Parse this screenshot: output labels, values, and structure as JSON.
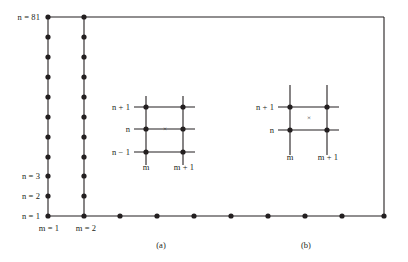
{
  "figure": {
    "background_color": "#ffffff",
    "line_color": "#231f20",
    "node_color": "#231f20",
    "text_color": "#231f20"
  },
  "grid": {
    "name": "computational-grid",
    "left_column_label_top": "n = 81",
    "left_axis_labels": [
      {
        "text": "n = 81",
        "n": 81
      },
      {
        "text": "n = 3",
        "n": 3
      },
      {
        "text": "n = 2",
        "n": 2
      },
      {
        "text": "n = 1",
        "n": 1
      }
    ],
    "bottom_axis_labels": [
      {
        "text": "m = 1",
        "m": 1
      },
      {
        "text": "m = 2",
        "m": 2
      }
    ],
    "column_node_count": 11,
    "bottom_node_count": 11
  },
  "stencil_a": {
    "name": "stencil-a",
    "caption": "(a)",
    "row_labels": [
      "n + 1",
      "n",
      "n − 1"
    ],
    "column_labels": [
      "m",
      "m + 1"
    ],
    "marker": "×",
    "marker_position": "mid-row-between-columns",
    "node_count": 6
  },
  "stencil_b": {
    "name": "stencil-b",
    "caption": "(b)",
    "row_labels": [
      "n + 1",
      "n"
    ],
    "column_labels": [
      "m",
      "m + 1"
    ],
    "marker": "×",
    "marker_position": "cell-center",
    "node_count": 4
  },
  "captions": {
    "a": "(a)",
    "b": "(b)"
  }
}
